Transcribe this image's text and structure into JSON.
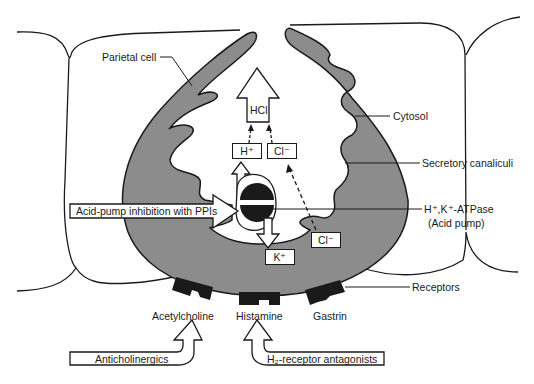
{
  "diagram": {
    "labels": {
      "parietal_cell": "Parietal cell",
      "cytosol": "Cytosol",
      "secretory_canaliculi": "Secretory canaliculi",
      "pump_line1": "H⁺,K⁺-ATPase",
      "pump_line2": "(Acid pump)",
      "receptors": "Receptors"
    },
    "ions": {
      "hcl": "HCl",
      "h_plus": "H⁺",
      "cl_minus_top": "Cl⁻",
      "cl_minus_bottom": "Cl⁻",
      "k_plus": "K⁺"
    },
    "receptors": [
      {
        "ligand": "Acetylcholine"
      },
      {
        "ligand": "Histamine"
      },
      {
        "ligand": "Gastrin"
      }
    ],
    "drugs": {
      "ppi": "Acid-pump inhibition with PPIs",
      "anticholinergics": "Anticholinergics",
      "h2_antagonists": "H₂-receptor antagonists"
    },
    "colors": {
      "cytosol_fill": "#8c8c8c",
      "outline": "#1a1a1a",
      "receptor": "#1a1a1a",
      "background": "#ffffff"
    }
  }
}
